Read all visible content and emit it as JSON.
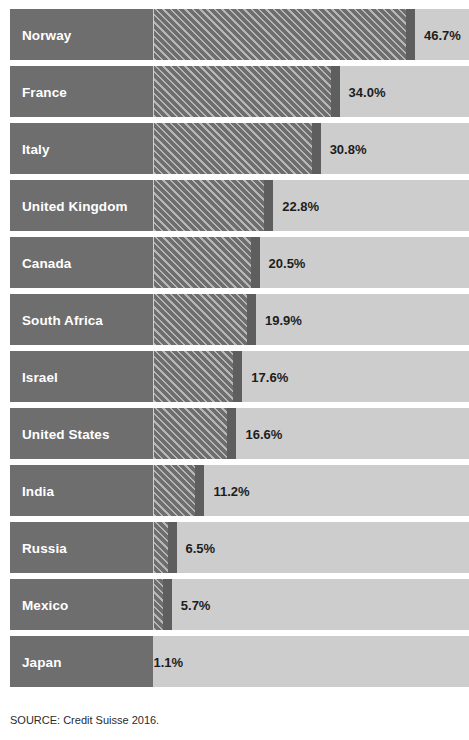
{
  "source_note": "SOURCE: Credit Suisse 2016.",
  "chart_data": {
    "type": "bar",
    "orientation": "horizontal",
    "title": "",
    "xlabel": "",
    "ylabel": "",
    "xlim": [
      0,
      50
    ],
    "grid": false,
    "legend": false,
    "value_suffix": "%",
    "categories": [
      "Norway",
      "France",
      "Italy",
      "United Kingdom",
      "Canada",
      "South Africa",
      "Israel",
      "United States",
      "India",
      "Russia",
      "Mexico",
      "Japan"
    ],
    "values": [
      46.7,
      34.0,
      30.8,
      22.8,
      20.5,
      19.9,
      17.6,
      16.6,
      11.2,
      6.5,
      5.7,
      1.1
    ],
    "value_labels": [
      "46.7%",
      "34.0%",
      "30.8%",
      "22.8%",
      "20.5%",
      "19.9%",
      "17.6%",
      "16.6%",
      "11.2%",
      "6.5%",
      "5.7%",
      "1.1%"
    ],
    "colors": {
      "bar_fill": "#6e6e6e",
      "bar_hatch_line": "#b6b6b6",
      "bar_cap": "#5e5e5e",
      "track": "#cdcdcd",
      "label_block": "#6e6e6e",
      "label_text": "#ffffff",
      "value_text": "#1d1d1d",
      "page_background": "#ffffff"
    }
  }
}
